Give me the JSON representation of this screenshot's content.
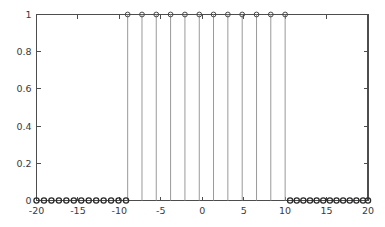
{
  "chart_data": {
    "type": "scatter",
    "title": "",
    "subtitle": "",
    "xlabel": "",
    "ylabel": "",
    "xlim": [
      -20,
      20
    ],
    "ylim": [
      0,
      1
    ],
    "grid": false,
    "legend": null,
    "xticks": [
      -20,
      -15,
      -10,
      -5,
      0,
      5,
      10,
      15,
      20
    ],
    "xticklabels": [
      "-20",
      "-15",
      "-10",
      "-5",
      "0",
      "5",
      "10",
      "15",
      "20"
    ],
    "yticks": [
      0,
      0.2,
      0.4,
      0.6,
      0.8,
      1
    ],
    "yticklabels": [
      "0",
      "0.2",
      "0.4",
      "0.6",
      "0.8",
      "1"
    ],
    "marker": "circle-open",
    "series": [
      {
        "name": "rect pulse",
        "style": "stem",
        "x": [
          -20.0,
          -19.1,
          -18.2,
          -17.3,
          -16.4,
          -15.5,
          -14.6,
          -13.7,
          -12.8,
          -11.9,
          -11.0,
          -10.1,
          -9.2,
          -9.0,
          -7.27,
          -5.55,
          -3.82,
          -2.09,
          -0.36,
          1.36,
          3.09,
          4.82,
          6.55,
          8.27,
          10.0,
          10.6,
          11.4,
          12.2,
          13.0,
          13.8,
          14.6,
          15.4,
          16.2,
          17.0,
          17.8,
          18.6,
          19.4,
          20.0
        ],
        "y": [
          0,
          0,
          0,
          0,
          0,
          0,
          0,
          0,
          0,
          0,
          0,
          0,
          0,
          1,
          1,
          1,
          1,
          1,
          1,
          1,
          1,
          1,
          1,
          1,
          1,
          0,
          0,
          0,
          0,
          0,
          0,
          0,
          0,
          0,
          0,
          0,
          0,
          0
        ]
      }
    ]
  },
  "axes": {
    "frame_color": "#4d4d4d",
    "stem_color": "#9a9a9a",
    "marker_edge_color": "#3a3a3a",
    "background_color": "#ffffff"
  }
}
